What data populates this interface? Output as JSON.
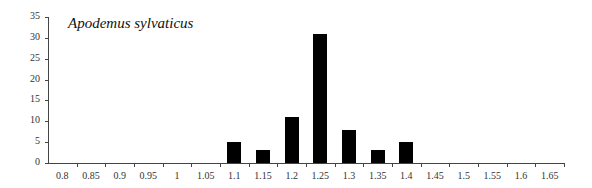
{
  "chart_data": {
    "type": "bar",
    "title": "Apodemus sylvaticus",
    "xlabel": "",
    "ylabel": "",
    "ylim": [
      0,
      35
    ],
    "yticks": [
      0,
      5,
      10,
      15,
      20,
      25,
      30,
      35
    ],
    "grid": false,
    "legend": null,
    "categories": [
      "0.8",
      "0.85",
      "0.9",
      "0.95",
      "1",
      "1.05",
      "1.1",
      "1.15",
      "1.2",
      "1.25",
      "1.3",
      "1.35",
      "1.4",
      "1.45",
      "1.5",
      "1.55",
      "1.6",
      "1.65"
    ],
    "values": [
      0,
      0,
      0,
      0,
      0,
      0,
      5,
      3,
      11,
      31,
      8,
      3,
      5,
      0,
      0,
      0,
      0,
      0
    ],
    "bar_color": "#000000"
  }
}
